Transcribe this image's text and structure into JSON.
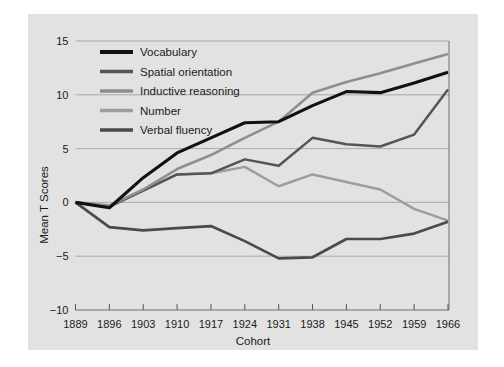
{
  "chart_data": {
    "type": "line",
    "title": "",
    "xlabel": "Cohort",
    "ylabel": "Mean T Scores",
    "x": [
      1889,
      1896,
      1903,
      1910,
      1917,
      1924,
      1931,
      1938,
      1945,
      1952,
      1959,
      1966
    ],
    "xtick_labels": [
      "1889",
      "1896",
      "1903",
      "1910",
      "1917",
      "1924",
      "1931",
      "1938",
      "1945",
      "1952",
      "1959",
      "1966"
    ],
    "ytick_labels": [
      "15",
      "10",
      "5",
      "0",
      "−5",
      "−10"
    ],
    "yticks": [
      15,
      10,
      5,
      0,
      -5,
      -10
    ],
    "ylim": [
      -10,
      15
    ],
    "xlim": [
      1889,
      1966
    ],
    "grid": true,
    "legend_position": "upper-left-inside",
    "series": [
      {
        "name": "Vocabulary",
        "color": "#111111",
        "width": 3.1,
        "values": [
          0.0,
          -0.5,
          2.3,
          4.6,
          6.0,
          7.4,
          7.5,
          9.0,
          10.3,
          10.2,
          11.1,
          12.1
        ]
      },
      {
        "name": "Spatial orientation",
        "color": "#555555",
        "width": 2.5,
        "values": [
          0.0,
          -0.4,
          1.1,
          2.6,
          2.7,
          4.0,
          3.4,
          6.0,
          5.4,
          5.2,
          6.3,
          10.5
        ]
      },
      {
        "name": "Inductive reasoning",
        "color": "#8e8e8e",
        "width": 2.6,
        "values": [
          0.0,
          -0.3,
          1.2,
          3.1,
          4.4,
          6.0,
          7.5,
          10.2,
          11.2,
          12.0,
          12.9,
          13.8
        ]
      },
      {
        "name": "Number",
        "color": "#9d9d9d",
        "width": 2.5,
        "values": [
          0.0,
          -0.4,
          1.1,
          2.6,
          2.7,
          3.3,
          1.5,
          2.6,
          1.9,
          1.2,
          -0.6,
          -1.7
        ]
      },
      {
        "name": "Verbal fluency",
        "color": "#4a4a4a",
        "width": 2.7,
        "values": [
          0.0,
          -2.3,
          -2.6,
          -2.4,
          -2.2,
          -3.6,
          -5.2,
          -5.1,
          -3.4,
          -3.4,
          -2.9,
          -1.8
        ]
      }
    ]
  },
  "legend": {
    "items": [
      {
        "label": "Vocabulary"
      },
      {
        "label": "Spatial orientation"
      },
      {
        "label": "Inductive reasoning"
      },
      {
        "label": "Number"
      },
      {
        "label": "Verbal fluency"
      }
    ]
  },
  "colors": {
    "figure_background": "#ffffff",
    "plot_background": "#e2e2e2",
    "gridline": "#9a9a9a",
    "axis": "#6e6e6e",
    "text": "#1a1a1a"
  }
}
